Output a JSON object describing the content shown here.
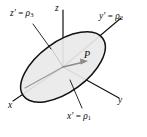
{
  "figure": {
    "background_color": "#ffffff",
    "stroke_color": "#111111",
    "ellipse_fill_color": "#e9e9e9",
    "ellipse_stroke_color": "#111111",
    "inner_axis_color": "#9a9a9a",
    "arrow_color": "#8c8c8c"
  },
  "labels": {
    "z_axis": "z",
    "x_axis": "x",
    "y_axis": "y",
    "point": "P",
    "z_prime": {
      "symbol": "z",
      "prime": "′",
      "equals": "=",
      "rho": "ρ",
      "subscript": "3"
    },
    "y_prime": {
      "symbol": "y",
      "prime": "′",
      "equals": "=",
      "rho": "ρ",
      "subscript": "2"
    },
    "x_prime": {
      "symbol": "x",
      "prime": "′",
      "equals": "=",
      "rho": "ρ",
      "subscript": "1"
    }
  },
  "geometry": {
    "origin": {
      "x": 63,
      "y": 67
    },
    "z_axis_top": {
      "x": 63,
      "y": 10
    },
    "x_axis_end": {
      "x": 13,
      "y": 101
    },
    "y_axis_end": {
      "x": 119,
      "y": 98
    },
    "y_prime_axis_end": {
      "x": 121,
      "y": 18
    },
    "ellipse": {
      "cx": 63,
      "cy": 67,
      "rx": 49,
      "ry": 25,
      "rotation_deg": -36
    },
    "point_P": {
      "x": 86,
      "y": 60
    },
    "leader_z_prime": {
      "from": {
        "x": 33,
        "y": 24
      },
      "to": {
        "x": 51,
        "y": 48
      }
    },
    "leader_x_prime": {
      "from": {
        "x": 82,
        "y": 108
      },
      "to": {
        "x": 70,
        "y": 80
      }
    }
  }
}
